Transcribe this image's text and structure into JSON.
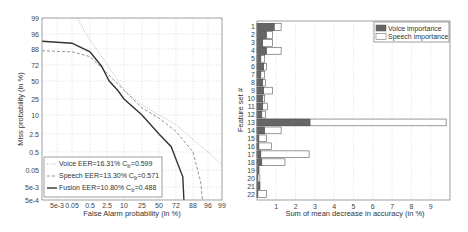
{
  "chart_data": [
    {
      "type": "line",
      "title": "",
      "xlabel": "False Alarm probability (in %)",
      "ylabel": "Miss probability (in %)",
      "scale": "DET (normal deviate)",
      "xticks": [
        "5e-3",
        "0.05",
        "0.5",
        "2.5",
        "10",
        "25",
        "50",
        "72",
        "88",
        "96",
        "99"
      ],
      "yticks": [
        "99",
        "96",
        "88",
        "72",
        "50",
        "25",
        "10",
        "2.5",
        "0.5",
        "0.05",
        "5e-3",
        "5e-4"
      ],
      "grid": true,
      "legend_position": "lower left",
      "series": [
        {
          "name": "Voice EER=16.31% C_llr=0.599",
          "label_main": "Voice EER=16.31% C",
          "label_sub": "llr",
          "label_tail": "=0.599",
          "style": "dotted",
          "color": "#aaaaaa",
          "points": [
            [
              0.1,
              99
            ],
            [
              0.3,
              96
            ],
            [
              1.5,
              80
            ],
            [
              5,
              55
            ],
            [
              10,
              35
            ],
            [
              25,
              18
            ],
            [
              50,
              10
            ],
            [
              72,
              5
            ],
            [
              88,
              1.5
            ],
            [
              96,
              0.5
            ],
            [
              99,
              0.1
            ]
          ]
        },
        {
          "name": "Speech EER=13.30% C_llr=0.571",
          "label_main": "Speech EER=13.30% C",
          "label_sub": "llr",
          "label_tail": "=0.571",
          "style": "dashed",
          "color": "#888888",
          "points": [
            [
              0.0005,
              86
            ],
            [
              0.05,
              85
            ],
            [
              0.5,
              80
            ],
            [
              2.5,
              60
            ],
            [
              10,
              35
            ],
            [
              25,
              15
            ],
            [
              50,
              8
            ],
            [
              72,
              3
            ],
            [
              88,
              0.5
            ],
            [
              92,
              0.01
            ],
            [
              93,
              0.0005
            ]
          ]
        },
        {
          "name": "Fusion EER=10.80% C_llr=0.488",
          "label_main": "Fusion EER=10.80% C",
          "label_sub": "llr",
          "label_tail": "=0.488",
          "style": "solid",
          "color": "#333333",
          "points": [
            [
              0.0005,
              92
            ],
            [
              0.05,
              91
            ],
            [
              0.5,
              85
            ],
            [
              1.5,
              70
            ],
            [
              3,
              50
            ],
            [
              6,
              35
            ],
            [
              10,
              25
            ],
            [
              25,
              10
            ],
            [
              50,
              2.5
            ],
            [
              65,
              0.8
            ],
            [
              72,
              0.2
            ],
            [
              78,
              0.02
            ],
            [
              79,
              0.0005
            ]
          ]
        }
      ]
    },
    {
      "type": "bar",
      "orientation": "horizontal",
      "title": "",
      "xlabel": "Sum of mean decrease in accuracy (in %)",
      "ylabel": "Feature set #",
      "xlim": [
        0,
        10
      ],
      "xticks": [
        "1",
        "2",
        "3",
        "4",
        "5",
        "6",
        "7",
        "8",
        "9"
      ],
      "grid": true,
      "legend_position": "upper right",
      "categories": [
        "1",
        "2",
        "3",
        "4",
        "5",
        "6",
        "7",
        "8",
        "9",
        "10",
        "11",
        "12",
        "13",
        "14",
        "15",
        "16",
        "17",
        "18",
        "19",
        "20",
        "21",
        "22"
      ],
      "series": [
        {
          "name": "Voice importance",
          "color": "#666666",
          "values": [
            0.9,
            0.5,
            0.3,
            0.5,
            0.2,
            0.35,
            0.2,
            0.3,
            0.35,
            0.3,
            0.3,
            0.25,
            2.75,
            0.4,
            0.1,
            0.1,
            0.2,
            0.25,
            0.1,
            0.05,
            0.15,
            0.05
          ]
        },
        {
          "name": "Speech importance",
          "color": "#ffffff",
          "values": [
            1.25,
            0.8,
            0.8,
            1.25,
            0.4,
            0.5,
            0.4,
            0.45,
            0.8,
            0.4,
            0.55,
            0.45,
            9.8,
            1.25,
            0.5,
            0.75,
            2.7,
            1.45,
            0.1,
            0.15,
            0.15,
            0.5
          ]
        }
      ]
    }
  ]
}
